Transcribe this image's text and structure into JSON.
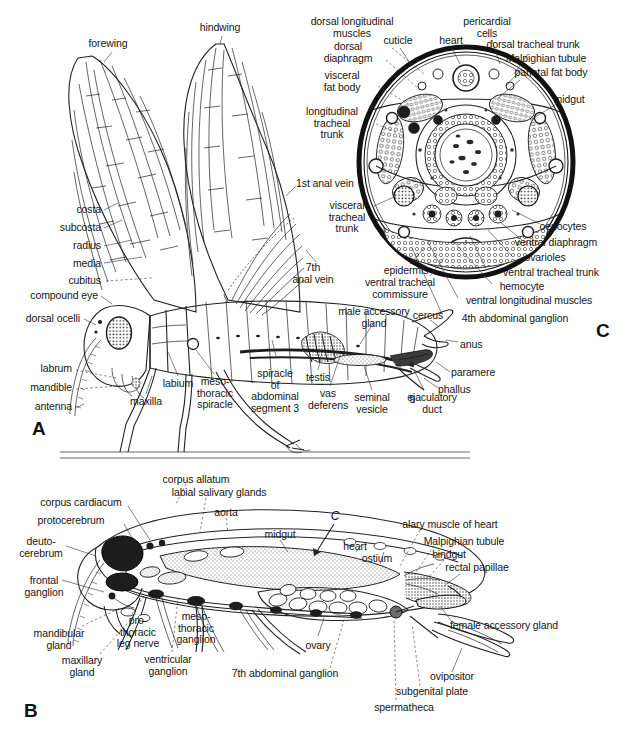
{
  "figure": {
    "title_visible": false,
    "background_color": "#ffffff",
    "ink_color": "#1a1a1a",
    "panels": [
      {
        "id": "A",
        "letter": "A",
        "caption": "lateral view of male grasshopper external anatomy and reproductive system"
      },
      {
        "id": "B",
        "letter": "B",
        "caption": "sagittal view of female grasshopper internal anatomy"
      },
      {
        "id": "C",
        "letter": "C",
        "caption": "transverse section through the abdomen"
      }
    ]
  },
  "panel_a": {
    "letter": "A",
    "labels": [
      {
        "id": "forewing",
        "text": "forewing",
        "x": 108,
        "y": 44,
        "align": "center"
      },
      {
        "id": "hindwing",
        "text": "hindwing",
        "x": 220,
        "y": 28,
        "align": "center"
      },
      {
        "id": "costa",
        "text": "costa",
        "x": 101,
        "y": 209,
        "align": "right"
      },
      {
        "id": "subcosta",
        "text": "subcosta",
        "x": 101,
        "y": 227,
        "align": "right"
      },
      {
        "id": "radius",
        "text": "radius",
        "x": 101,
        "y": 245,
        "align": "right"
      },
      {
        "id": "media",
        "text": "media",
        "x": 101,
        "y": 263,
        "align": "right"
      },
      {
        "id": "cubitus",
        "text": "cubitus",
        "x": 101,
        "y": 280,
        "align": "right"
      },
      {
        "id": "compound-eye",
        "text": "compound eye",
        "x": 98,
        "y": 295,
        "align": "right"
      },
      {
        "id": "dorsal-ocelli",
        "text": "dorsal ocelli",
        "x": 80,
        "y": 318,
        "align": "right"
      },
      {
        "id": "labrum",
        "text": "labrum",
        "x": 72,
        "y": 368,
        "align": "right"
      },
      {
        "id": "mandible",
        "text": "mandible",
        "x": 72,
        "y": 387,
        "align": "right"
      },
      {
        "id": "antenna",
        "text": "antenna",
        "x": 72,
        "y": 406,
        "align": "right"
      },
      {
        "id": "labium",
        "text": "labium",
        "x": 178,
        "y": 383,
        "align": "center"
      },
      {
        "id": "maxilla",
        "text": "maxilla",
        "x": 146,
        "y": 401,
        "align": "center"
      },
      {
        "id": "mesothoracic-spiracle",
        "text": "meso-\nthoracic\nspiracle",
        "x": 215,
        "y": 386,
        "align": "center"
      },
      {
        "id": "spiracle-abdominal-segment-3",
        "text": "spiracle\nof\nabdominal\nsegment 3",
        "x": 275,
        "y": 378,
        "align": "center"
      },
      {
        "id": "testis",
        "text": "testis",
        "x": 318,
        "y": 382,
        "align": "center"
      },
      {
        "id": "vas-deferens",
        "text": "vas\ndeferens",
        "x": 328,
        "y": 396,
        "align": "center"
      },
      {
        "id": "seminal-vesicle",
        "text": "seminal\nvesicle",
        "x": 372,
        "y": 398,
        "align": "center"
      },
      {
        "id": "ejaculatory-duct",
        "text": "ejaculatory\nduct",
        "x": 430,
        "y": 398,
        "align": "center"
      },
      {
        "id": "male-accessory-gland",
        "text": "male accessory\ngland",
        "x": 374,
        "y": 312,
        "align": "center"
      },
      {
        "id": "cercus",
        "text": "cercus",
        "x": 428,
        "y": 316,
        "align": "center"
      },
      {
        "id": "anus",
        "text": "anus",
        "x": 460,
        "y": 344,
        "align": "left"
      },
      {
        "id": "paramere",
        "text": "paramere",
        "x": 451,
        "y": 372,
        "align": "left"
      },
      {
        "id": "phallus",
        "text": "phallus",
        "x": 438,
        "y": 389,
        "align": "left"
      },
      {
        "id": "segment-9",
        "text": "9",
        "x": 412,
        "y": 399,
        "align": "center"
      },
      {
        "id": "first-anal-vein",
        "text": "1st anal vein",
        "x": 296,
        "y": 183,
        "align": "left"
      },
      {
        "id": "seventh-anal-vein",
        "text": "7th\nanal vein",
        "x": 313,
        "y": 268,
        "align": "center"
      }
    ]
  },
  "panel_c": {
    "letter": "C",
    "labels": [
      {
        "id": "dorsal-longitudinal-muscles",
        "text": "dorsal longitudinal\nmuscles",
        "x": 352,
        "y": 22,
        "align": "center"
      },
      {
        "id": "dorsal-diaphragm",
        "text": "dorsal\ndiaphragm",
        "x": 348,
        "y": 47,
        "align": "center"
      },
      {
        "id": "visceral-fat-body",
        "text": "visceral\nfat body",
        "x": 342,
        "y": 76,
        "align": "center"
      },
      {
        "id": "longitudinal-tracheal-trunk",
        "text": "longitudinal\ntracheal\ntrunk",
        "x": 332,
        "y": 112,
        "align": "center"
      },
      {
        "id": "cuticle",
        "text": "cuticle",
        "x": 398,
        "y": 40,
        "align": "center"
      },
      {
        "id": "heart",
        "text": "heart",
        "x": 449,
        "y": 40,
        "align": "center"
      },
      {
        "id": "pericardial-cells",
        "text": "pericardial\ncells",
        "x": 487,
        "y": 22,
        "align": "center"
      },
      {
        "id": "dorsal-tracheal-trunk",
        "text": "dorsal tracheal trunk",
        "x": 533,
        "y": 44,
        "align": "center"
      },
      {
        "id": "malpighian-tubule",
        "text": "Malpighian tubule",
        "x": 546,
        "y": 58,
        "align": "center"
      },
      {
        "id": "parietal-fat-body",
        "text": "parietal fat body",
        "x": 551,
        "y": 72,
        "align": "center"
      },
      {
        "id": "midgut",
        "text": "midgut",
        "x": 569,
        "y": 99,
        "align": "center"
      },
      {
        "id": "visceral-tracheal-trunk",
        "text": "visceral\ntracheal\ntrunk",
        "x": 347,
        "y": 212,
        "align": "center"
      },
      {
        "id": "epidermis",
        "text": "epidermis",
        "x": 406,
        "y": 270,
        "align": "center"
      },
      {
        "id": "ventral-tracheal-commissure",
        "text": "ventral tracheal\ncommissure",
        "x": 400,
        "y": 283,
        "align": "center"
      },
      {
        "id": "oenocytes",
        "text": "oenocytes",
        "x": 563,
        "y": 226,
        "align": "center"
      },
      {
        "id": "ventral-diaphragm",
        "text": "ventral diaphragm",
        "x": 556,
        "y": 242,
        "align": "center"
      },
      {
        "id": "ovarioles",
        "text": "ovarioles",
        "x": 545,
        "y": 257,
        "align": "center"
      },
      {
        "id": "ventral-tracheal-trunk",
        "text": "ventral tracheal trunk",
        "x": 551,
        "y": 272,
        "align": "center"
      },
      {
        "id": "hemocyte",
        "text": "hemocyte",
        "x": 522,
        "y": 286,
        "align": "center"
      },
      {
        "id": "ventral-longitudinal-muscles",
        "text": "ventral longitudinal muscles",
        "x": 529,
        "y": 300,
        "align": "center"
      },
      {
        "id": "fourth-abdominal-ganglion",
        "text": "4th abdominal ganglion",
        "x": 515,
        "y": 318,
        "align": "center"
      }
    ]
  },
  "panel_b": {
    "letter": "B",
    "section_marker": "C",
    "labels": [
      {
        "id": "corpus-allatum",
        "text": "corpus allatum",
        "x": 196,
        "y": 479,
        "align": "center"
      },
      {
        "id": "labial-salivary-glands",
        "text": "labial salivary glands",
        "x": 219,
        "y": 492,
        "align": "center"
      },
      {
        "id": "corpus-cardiacum",
        "text": "corpus cardiacum",
        "x": 81,
        "y": 502,
        "align": "center"
      },
      {
        "id": "protocerebrum",
        "text": "protocerebrum",
        "x": 71,
        "y": 520,
        "align": "center"
      },
      {
        "id": "aorta",
        "text": "aorta",
        "x": 226,
        "y": 512,
        "align": "center"
      },
      {
        "id": "midgut",
        "text": "midgut",
        "x": 280,
        "y": 534,
        "align": "center"
      },
      {
        "id": "section-marker-c",
        "text": "C",
        "x": 328,
        "y": 518,
        "align": "center"
      },
      {
        "id": "heart",
        "text": "heart",
        "x": 355,
        "y": 546,
        "align": "center"
      },
      {
        "id": "ostium",
        "text": "ostium",
        "x": 377,
        "y": 558,
        "align": "center"
      },
      {
        "id": "alary-muscle-of-heart",
        "text": "alary muscle of heart",
        "x": 450,
        "y": 524,
        "align": "center"
      },
      {
        "id": "malpighian-tubule",
        "text": "Malpighian tubule",
        "x": 464,
        "y": 541,
        "align": "center"
      },
      {
        "id": "hindgut",
        "text": "hindgut",
        "x": 449,
        "y": 554,
        "align": "center"
      },
      {
        "id": "rectal-papillae",
        "text": "rectal papillae",
        "x": 477,
        "y": 567,
        "align": "center"
      },
      {
        "id": "deutocerebrum",
        "text": "deuto-\ncerebrum",
        "x": 41,
        "y": 542,
        "align": "center"
      },
      {
        "id": "frontal-ganglion",
        "text": "frontal\nganglion",
        "x": 44,
        "y": 581,
        "align": "center"
      },
      {
        "id": "mandibular-gland",
        "text": "mandibular\ngland",
        "x": 59,
        "y": 634,
        "align": "center"
      },
      {
        "id": "maxillary-gland",
        "text": "maxillary\ngland",
        "x": 82,
        "y": 661,
        "align": "center"
      },
      {
        "id": "prothoracic-leg-nerve",
        "text": "pro-\nthoracic\nleg nerve",
        "x": 138,
        "y": 627,
        "align": "center"
      },
      {
        "id": "ventricular-ganglion",
        "text": "ventricular\nganglion",
        "x": 168,
        "y": 660,
        "align": "center"
      },
      {
        "id": "mesothoracic-ganglion",
        "text": "meso-\nthoracic\nganglion",
        "x": 196,
        "y": 623,
        "align": "center"
      },
      {
        "id": "ovary",
        "text": "ovary",
        "x": 318,
        "y": 645,
        "align": "center"
      },
      {
        "id": "seventh-abdominal-ganglion",
        "text": "7th abdominal ganglion",
        "x": 285,
        "y": 673,
        "align": "center"
      },
      {
        "id": "female-accessory-gland",
        "text": "female accessory gland",
        "x": 504,
        "y": 625,
        "align": "center"
      },
      {
        "id": "ovipositor",
        "text": "ovipositor",
        "x": 452,
        "y": 676,
        "align": "center"
      },
      {
        "id": "subgenital-plate",
        "text": "subgenital plate",
        "x": 432,
        "y": 691,
        "align": "center"
      },
      {
        "id": "spermatheca",
        "text": "spermatheca",
        "x": 404,
        "y": 707,
        "align": "center"
      }
    ]
  }
}
